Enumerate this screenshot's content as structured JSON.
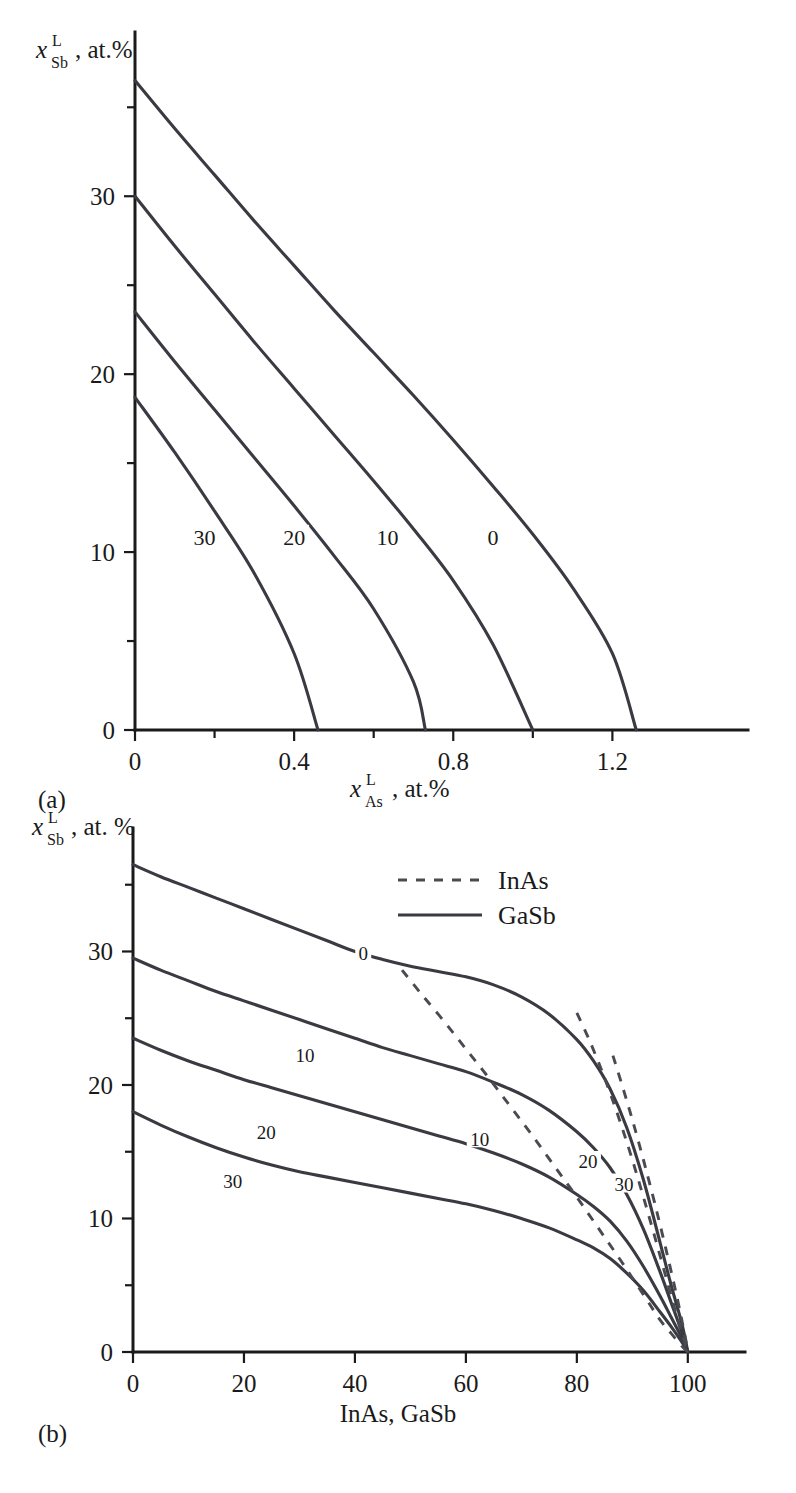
{
  "figure": {
    "panel_a_letter": "(a)",
    "panel_b_letter": "(b)"
  },
  "panel_a": {
    "y_axis": {
      "var": "x",
      "sup": "L",
      "sub": "Sb",
      "unit": ", at.%",
      "ticks": [
        "0",
        "10",
        "20",
        "30"
      ],
      "tick_values": [
        0,
        10,
        20,
        30
      ],
      "minor_values": [
        5,
        15,
        25,
        35
      ],
      "range": [
        0,
        38.5
      ]
    },
    "x_axis": {
      "var": "x",
      "sup": "L",
      "sub": "As",
      "unit": ", at.%",
      "ticks": [
        "0",
        "0.4",
        "0.8",
        "1.2"
      ],
      "tick_values": [
        0,
        0.4,
        0.8,
        1.2
      ],
      "minor_values": [
        0.2,
        0.6,
        1.0
      ],
      "range": [
        0,
        1.38
      ]
    },
    "contour_labels": [
      "30",
      "20",
      "10",
      "0"
    ]
  },
  "panel_b": {
    "y_axis": {
      "var": "x",
      "sup": "L",
      "sub": "Sb",
      "unit": ", at. %",
      "ticks": [
        "0",
        "10",
        "20",
        "30"
      ],
      "tick_values": [
        0,
        10,
        20,
        30
      ],
      "minor_values": [
        5,
        15,
        25,
        35
      ],
      "range": [
        0,
        38.5
      ]
    },
    "x_axis": {
      "title": "InAs, GaSb",
      "ticks": [
        "0",
        "20",
        "40",
        "60",
        "80",
        "100"
      ],
      "tick_values": [
        0,
        20,
        40,
        60,
        80,
        100
      ],
      "range": [
        0,
        104
      ]
    },
    "legend": {
      "items": [
        {
          "label": "InAs",
          "style": "dashed"
        },
        {
          "label": "GaSb",
          "style": "solid"
        }
      ]
    },
    "contour_labels_gasb": [
      "0",
      "10",
      "20",
      "30"
    ],
    "contour_labels_inas": [
      "10",
      "20",
      "30"
    ]
  },
  "colors": {
    "curve": "#3a3a42",
    "axis": "#1a1a1a",
    "background": "#ffffff"
  },
  "chart_data": [
    {
      "type": "line",
      "panel": "(a)",
      "title": "",
      "xlabel": "x_As^L, at.%",
      "ylabel": "x_Sb^L, at.%",
      "xlim": [
        0,
        1.38
      ],
      "ylim": [
        0,
        38.5
      ],
      "grid": false,
      "legend_position": "none",
      "series": [
        {
          "name": "0",
          "style": "solid",
          "label_position": [
            0.9,
            10.8
          ],
          "x": [
            0.0,
            0.1,
            0.2,
            0.3,
            0.4,
            0.5,
            0.6,
            0.7,
            0.8,
            0.9,
            1.0,
            1.1,
            1.2,
            1.26
          ],
          "y": [
            36.5,
            33.8,
            31.2,
            28.6,
            26.1,
            23.6,
            21.2,
            18.8,
            16.3,
            13.7,
            11.0,
            8.0,
            4.3,
            0.0
          ]
        },
        {
          "name": "10",
          "style": "solid",
          "label_position": [
            0.635,
            10.8
          ],
          "x": [
            0.0,
            0.1,
            0.2,
            0.3,
            0.4,
            0.5,
            0.6,
            0.7,
            0.8,
            0.9,
            1.0
          ],
          "y": [
            30.0,
            27.2,
            24.5,
            21.8,
            19.2,
            16.6,
            14.0,
            11.3,
            8.4,
            4.8,
            0.0
          ]
        },
        {
          "name": "20",
          "style": "solid",
          "label_position": [
            0.4,
            10.8
          ],
          "x": [
            0.0,
            0.1,
            0.2,
            0.3,
            0.4,
            0.5,
            0.6,
            0.7,
            0.73
          ],
          "y": [
            23.5,
            20.7,
            18.0,
            15.3,
            12.6,
            9.8,
            6.8,
            2.7,
            0.0
          ]
        },
        {
          "name": "30",
          "style": "solid",
          "label_position": [
            0.175,
            10.8
          ],
          "x": [
            0.0,
            0.1,
            0.2,
            0.3,
            0.4,
            0.46
          ],
          "y": [
            18.7,
            15.6,
            12.3,
            8.8,
            4.3,
            0.0
          ]
        }
      ]
    },
    {
      "type": "line",
      "panel": "(b)",
      "title": "",
      "xlabel": "InAs, GaSb",
      "ylabel": "x_Sb^L, at. %",
      "xlim": [
        0,
        104
      ],
      "ylim": [
        0,
        38.5
      ],
      "grid": false,
      "legend_position": "upper-right",
      "series": [
        {
          "name": "0",
          "style": "solid",
          "legend_group": "GaSb",
          "label_position": [
            41.5,
            29.8
          ],
          "x": [
            0,
            5,
            10,
            15,
            20,
            25,
            30,
            35,
            40,
            45,
            50,
            55,
            60,
            65,
            70,
            75,
            80,
            83,
            86,
            89,
            92,
            95,
            97,
            99,
            100
          ],
          "y": [
            36.5,
            35.6,
            34.8,
            34.0,
            33.2,
            32.4,
            31.6,
            30.8,
            30.0,
            29.4,
            28.9,
            28.5,
            28.1,
            27.5,
            26.6,
            25.3,
            23.4,
            21.8,
            19.7,
            16.8,
            12.9,
            8.2,
            5.0,
            2.0,
            0.0
          ]
        },
        {
          "name": "10",
          "style": "solid",
          "legend_group": "GaSb",
          "label_position": [
            31,
            22.2
          ],
          "x": [
            0,
            5,
            10,
            15,
            20,
            25,
            30,
            35,
            40,
            45,
            50,
            55,
            60,
            65,
            70,
            75,
            80,
            83,
            86,
            89,
            92,
            95,
            97,
            99,
            100
          ],
          "y": [
            29.5,
            28.6,
            27.8,
            27.0,
            26.3,
            25.6,
            24.9,
            24.2,
            23.5,
            22.8,
            22.2,
            21.6,
            21.0,
            20.2,
            19.3,
            18.1,
            16.5,
            15.3,
            13.8,
            11.8,
            9.2,
            6.0,
            3.7,
            1.4,
            0.0
          ]
        },
        {
          "name": "20",
          "style": "solid",
          "legend_group": "GaSb",
          "label_position": [
            24,
            16.4
          ],
          "x": [
            0,
            5,
            10,
            15,
            20,
            25,
            30,
            35,
            40,
            45,
            50,
            55,
            60,
            65,
            70,
            75,
            80,
            83,
            86,
            89,
            92,
            95,
            97,
            99,
            100
          ],
          "y": [
            23.5,
            22.6,
            21.8,
            21.1,
            20.4,
            19.8,
            19.2,
            18.6,
            18.0,
            17.4,
            16.8,
            16.2,
            15.6,
            14.9,
            14.1,
            13.1,
            11.8,
            10.9,
            9.8,
            8.3,
            6.4,
            4.2,
            2.6,
            1.0,
            0.0
          ]
        },
        {
          "name": "30",
          "style": "solid",
          "legend_group": "GaSb",
          "label_position": [
            18,
            12.7
          ],
          "x": [
            0,
            5,
            10,
            15,
            20,
            25,
            30,
            35,
            40,
            45,
            50,
            55,
            60,
            65,
            70,
            75,
            80,
            83,
            86,
            89,
            92,
            95,
            97,
            99,
            100
          ],
          "y": [
            18.0,
            17.0,
            16.1,
            15.3,
            14.6,
            14.0,
            13.5,
            13.1,
            12.7,
            12.3,
            11.9,
            11.5,
            11.1,
            10.6,
            10.0,
            9.3,
            8.4,
            7.8,
            7.0,
            5.9,
            4.6,
            3.0,
            1.9,
            0.7,
            0.0
          ]
        },
        {
          "name": "10",
          "style": "dashed",
          "legend_group": "InAs",
          "label_position": [
            62.5,
            15.9
          ],
          "x": [
            48.5,
            52,
            56,
            60,
            64,
            68,
            72,
            76,
            80,
            84,
            88,
            92,
            95,
            97,
            99,
            100
          ],
          "y": [
            28.6,
            26.8,
            24.8,
            22.7,
            20.6,
            18.4,
            16.2,
            13.9,
            11.6,
            9.2,
            6.8,
            4.3,
            2.4,
            1.4,
            0.4,
            0.0
          ]
        },
        {
          "name": "20",
          "style": "dashed",
          "legend_group": "InAs",
          "label_position": [
            82,
            14.2
          ],
          "x": [
            80,
            82,
            84,
            86,
            88,
            90,
            92,
            94,
            96,
            98,
            99.5,
            100
          ],
          "y": [
            25.4,
            23.6,
            21.6,
            19.4,
            17.0,
            14.4,
            11.6,
            8.7,
            5.7,
            2.7,
            0.6,
            0.0
          ]
        },
        {
          "name": "30",
          "style": "dashed",
          "legend_group": "InAs",
          "label_position": [
            88.5,
            12.5
          ],
          "x": [
            86.5,
            88,
            90,
            92,
            94,
            96,
            98,
            99.5,
            100
          ],
          "y": [
            22.2,
            20.2,
            17.4,
            14.4,
            11.2,
            7.8,
            4.2,
            1.2,
            0.0
          ]
        }
      ]
    }
  ]
}
